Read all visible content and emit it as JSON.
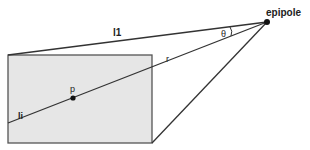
{
  "diagram": {
    "labels": {
      "epipole": "epipole",
      "l1": "l1",
      "theta": "θ",
      "r": "r",
      "p": "p",
      "li": "li"
    },
    "colors": {
      "image_plane_fill": "#e6e6e6",
      "stroke": "#333333",
      "background": "#ffffff"
    }
  }
}
